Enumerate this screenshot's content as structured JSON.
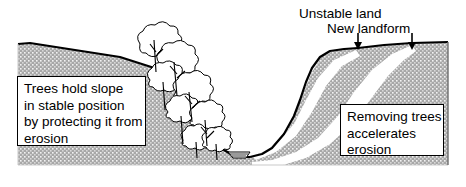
{
  "figure": {
    "width": 466,
    "height": 187,
    "background_color": "#ffffff"
  },
  "colors": {
    "ground_fill": "#a8a8a8",
    "ground_stipple": "#ffffff",
    "outline": "#000000",
    "new_landform_band": "#ffffff",
    "text": "#000000",
    "callout_background": "#ffffff",
    "callout_border": "#000000"
  },
  "annotations": [
    {
      "id": "unstable-land",
      "label": "Unstable land",
      "arrow": "down-arrow",
      "arrow_x": 358,
      "arrow_top": 33,
      "arrow_bottom": 49
    },
    {
      "id": "new-landform",
      "label": "New landform",
      "arrow": "down-arrow",
      "arrow_x": 412,
      "arrow_top": 33,
      "arrow_bottom": 49
    }
  ],
  "callouts": [
    {
      "id": "left-callout",
      "lines": [
        "Trees hold slope",
        "in stable position",
        "by protecting it from",
        "erosion"
      ],
      "text": "Trees hold slope\nin stable position\nby protecting it from\nerosion"
    },
    {
      "id": "right-callout",
      "lines": [
        "Removing trees",
        "accelerates",
        "erosion"
      ],
      "text": "Removing trees\naccelerates\nerosion"
    }
  ],
  "scene": {
    "left_slope_vegetation": "trees",
    "right_slope_vegetation": "none",
    "valley_floor_feature": "stream",
    "original_land_surface": "black outline",
    "eroded_surface": "white band below original surface on right slope"
  }
}
